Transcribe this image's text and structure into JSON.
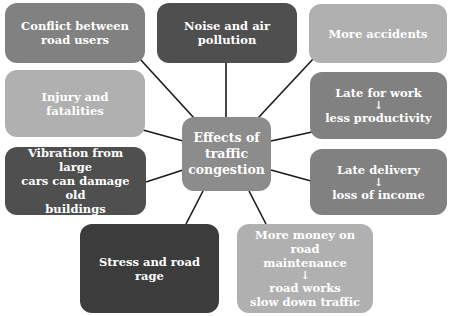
{
  "diagram": {
    "center": {
      "lines": [
        "Effects of",
        "traffic",
        "congestion"
      ]
    },
    "nodes": [
      {
        "id": "conflict",
        "lines": [
          "Conflict between",
          "road users"
        ],
        "color": "#818181"
      },
      {
        "id": "noise",
        "lines": [
          "Noise and air pollution"
        ],
        "color": "#4f4f4f"
      },
      {
        "id": "accidents",
        "lines": [
          "More accidents"
        ],
        "color": "#b0b0b0"
      },
      {
        "id": "injury",
        "lines": [
          "Injury and fatalities"
        ],
        "color": "#b0b0b0"
      },
      {
        "id": "late-work",
        "lines": [
          "Late for work",
          "↓",
          "less productivity"
        ],
        "color": "#818181"
      },
      {
        "id": "vibration",
        "lines": [
          "Vibration from large",
          "cars can damage old",
          "buildings"
        ],
        "color": "#4f4f4f"
      },
      {
        "id": "late-delivery",
        "lines": [
          "Late delivery",
          "↓",
          "loss of income"
        ],
        "color": "#818181"
      },
      {
        "id": "stress",
        "lines": [
          "Stress and road rage"
        ],
        "color": "#3c3c3c"
      },
      {
        "id": "road-money",
        "lines": [
          "More money on road",
          "maintenance",
          "↓",
          "road works",
          "slow down traffic"
        ],
        "color": "#b0b0b0"
      }
    ]
  }
}
